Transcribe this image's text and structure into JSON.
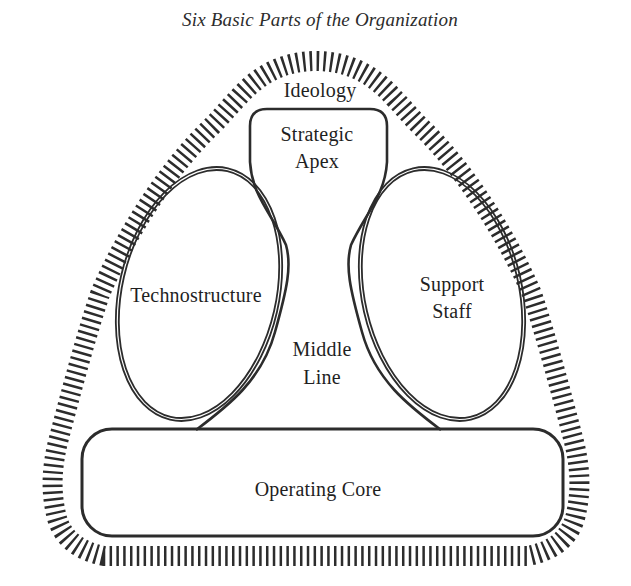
{
  "title": "Six Basic Parts of the Organization",
  "diagram": {
    "labels": {
      "ideology": "Ideology",
      "strategic_apex": {
        "line1": "Strategic",
        "line2": "Apex"
      },
      "technostructure": "Technostructure",
      "support_staff": {
        "line1": "Support",
        "line2": "Staff"
      },
      "middle_line": {
        "line1": "Middle",
        "line2": "Line"
      },
      "operating_core": "Operating Core"
    },
    "colors": {
      "ink": "#2c2c2c",
      "text": "#1f1f1f",
      "background": "#ffffff"
    }
  }
}
